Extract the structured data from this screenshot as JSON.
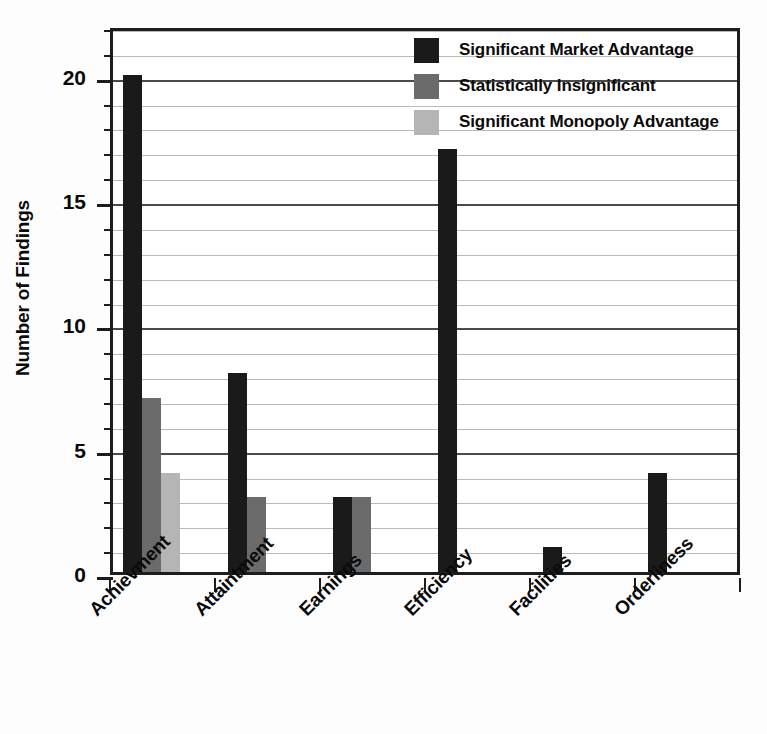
{
  "chart_data": {
    "type": "bar",
    "title": "",
    "subtitle": "",
    "xlabel": "",
    "ylabel": "Number of Findings",
    "categories": [
      "Achievment",
      "Attaintment",
      "Earnings",
      "Efficiency",
      "Facilities",
      "Orderliness"
    ],
    "series": [
      {
        "name": "Significant Market Advantage",
        "color": "#1a1a1a",
        "values": [
          20,
          8,
          3,
          17,
          1,
          4
        ]
      },
      {
        "name": "Statistically Insignificant",
        "color": "#6b6b6b",
        "values": [
          7,
          3,
          3,
          0,
          0,
          0
        ]
      },
      {
        "name": "Significant Monopoly Advantage",
        "color": "#b5b5b5",
        "values": [
          4,
          0,
          0,
          0,
          0,
          0
        ]
      }
    ],
    "ylim": [
      0,
      22
    ],
    "ytick_labels": [
      "0",
      "5",
      "10",
      "15",
      "20"
    ],
    "ytick_values": [
      0,
      5,
      10,
      15,
      20
    ],
    "yminor_step": 1,
    "grid": true,
    "grid_axis": "y",
    "legend_position": "top-right",
    "legend_frame": false,
    "bar_grouping": "adjacent",
    "xtick_style": "category-boundaries"
  },
  "legend": {
    "items": [
      {
        "label": "Significant Market Advantage",
        "color": "#1a1a1a",
        "swatch_name": "legend-swatch-black"
      },
      {
        "label": "Statistically Insignificant",
        "color": "#6b6b6b",
        "swatch_name": "legend-swatch-dark-gray"
      },
      {
        "label": "Significant Monopoly Advantage",
        "color": "#b5b5b5",
        "swatch_name": "legend-swatch-light-gray"
      }
    ]
  },
  "axes": {
    "y_title": "Number of Findings"
  },
  "colors": {
    "axis": "#1d1d1d",
    "grid_minor": "#b9b9b9",
    "grid_major": "#4a4a4a",
    "text": "#0a0a0a",
    "background": "#ffffff"
  }
}
